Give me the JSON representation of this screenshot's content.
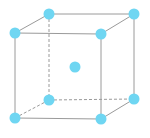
{
  "diagram": {
    "type": "body-centered-cubic-unit-cell",
    "colors": {
      "edge": "#9a9a9a",
      "atom": "#6fd6f2",
      "background": "#ffffff"
    },
    "atom_radius": 5.5,
    "atoms": [
      {
        "id": "back-top-left",
        "x": 49,
        "y": 14
      },
      {
        "id": "back-top-right",
        "x": 134,
        "y": 14
      },
      {
        "id": "front-top-left",
        "x": 15,
        "y": 33
      },
      {
        "id": "front-top-right",
        "x": 101,
        "y": 34
      },
      {
        "id": "back-bottom-left",
        "x": 49,
        "y": 100
      },
      {
        "id": "back-bottom-right",
        "x": 134,
        "y": 99
      },
      {
        "id": "front-bottom-left",
        "x": 15,
        "y": 118
      },
      {
        "id": "front-bottom-right",
        "x": 101,
        "y": 119
      },
      {
        "id": "body-center",
        "x": 75,
        "y": 67
      }
    ],
    "edges": [
      {
        "from": "front-top-left",
        "to": "front-top-right",
        "style": "solid"
      },
      {
        "from": "front-top-right",
        "to": "front-bottom-right",
        "style": "solid"
      },
      {
        "from": "front-bottom-right",
        "to": "front-bottom-left",
        "style": "solid"
      },
      {
        "from": "front-bottom-left",
        "to": "front-top-left",
        "style": "solid"
      },
      {
        "from": "back-top-left",
        "to": "back-top-right",
        "style": "solid"
      },
      {
        "from": "back-top-right",
        "to": "back-bottom-right",
        "style": "solid"
      },
      {
        "from": "front-top-left",
        "to": "back-top-left",
        "style": "solid"
      },
      {
        "from": "front-top-right",
        "to": "back-top-right",
        "style": "solid"
      },
      {
        "from": "front-bottom-right",
        "to": "back-bottom-right",
        "style": "solid"
      },
      {
        "from": "back-top-left",
        "to": "back-bottom-left",
        "style": "dashed"
      },
      {
        "from": "back-bottom-left",
        "to": "back-bottom-right",
        "style": "dashed"
      },
      {
        "from": "front-bottom-left",
        "to": "back-bottom-left",
        "style": "dashed"
      }
    ]
  }
}
